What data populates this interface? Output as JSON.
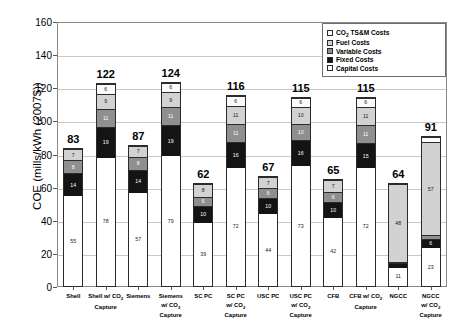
{
  "chart_data": {
    "type": "bar",
    "subtype": "stacked",
    "title": "",
    "xlabel": "",
    "ylabel": "COE (mills/kWh (2007$))",
    "ylim": [
      0,
      160
    ],
    "ytick_step": 20,
    "yticks": [
      0,
      20,
      40,
      60,
      80,
      100,
      120,
      140,
      160
    ],
    "grid": true,
    "legend_position": "top-right",
    "legend": [
      "CO2 TS&M Costs",
      "Fuel Costs",
      "Variable Costs",
      "Fixed Costs",
      "Capital Costs"
    ],
    "categories": [
      "Shell",
      "Shell w/ CO2 Capture",
      "Siemens",
      "Siemens w/ CO2 Capture",
      "SC PC",
      "SC PC w/ CO2 Capture",
      "USC PC",
      "USC PC w/ CO2 Capture",
      "CFB",
      "CFB w/ CO2 Capture",
      "NGCC",
      "NGCC w/ CO2 Capture"
    ],
    "series": [
      {
        "name": "Capital Costs",
        "values": [
          55,
          78,
          57,
          79,
          39,
          72,
          44,
          73,
          42,
          72,
          11,
          23
        ]
      },
      {
        "name": "Fixed Costs",
        "values": [
          14,
          19,
          14,
          19,
          10,
          16,
          10,
          16,
          10,
          15,
          3,
          6
        ]
      },
      {
        "name": "Variable Costs",
        "values": [
          8,
          11,
          8,
          11,
          6,
          11,
          6,
          10,
          6,
          11,
          1,
          2
        ]
      },
      {
        "name": "Fuel Costs",
        "values": [
          7,
          9,
          7,
          9,
          8,
          11,
          7,
          10,
          7,
          11,
          48,
          57
        ]
      },
      {
        "name": "CO2 TS&M Costs",
        "values": [
          0,
          6,
          0,
          6,
          0,
          6,
          0,
          6,
          0,
          6,
          0,
          3
        ]
      }
    ],
    "totals": [
      83,
      122,
      87,
      124,
      62,
      116,
      67,
      115,
      65,
      115,
      64,
      91
    ]
  },
  "axis": {
    "y_title": "COE (mills/kWh (2007$))",
    "y_tick_labels": [
      "0",
      "20",
      "40",
      "60",
      "80",
      "100",
      "120",
      "140",
      "160"
    ]
  },
  "legend": {
    "items": [
      {
        "label_pre": "CO",
        "label_sub": "2",
        "label_post": " TS&M Costs",
        "color": "#fbfbfb"
      },
      {
        "label_pre": "Fuel Costs",
        "label_sub": "",
        "label_post": "",
        "color": "#d2d2d2"
      },
      {
        "label_pre": "Variable Costs",
        "label_sub": "",
        "label_post": "",
        "color": "#8f8f8f"
      },
      {
        "label_pre": "Fixed Costs",
        "label_sub": "",
        "label_post": "",
        "color": "#141414"
      },
      {
        "label_pre": "Capital Costs",
        "label_sub": "",
        "label_post": "",
        "color": "#ffffff"
      }
    ]
  },
  "x_axis_labels": [
    [
      "Shell"
    ],
    [
      "Shell w/ CO",
      "2"
    ],
    [
      "Siemens"
    ],
    [
      "Siemens",
      "w/ CO",
      "2",
      "Capture"
    ],
    [
      "SC PC"
    ],
    [
      "SC PC",
      "w/ CO",
      "2",
      "Capture"
    ],
    [
      "USC PC"
    ],
    [
      "USC PC",
      "w/ CO",
      "2",
      "Capture"
    ],
    [
      "CFB"
    ],
    [
      "CFB w/ CO",
      "2"
    ],
    [
      "NGCC"
    ],
    [
      "NGCC",
      "w/ CO",
      "2",
      "Capture"
    ]
  ],
  "colors": {
    "capital": "#ffffff",
    "fixed": "#141414",
    "variable": "#8f8f8f",
    "fuel": "#d2d2d2",
    "tsm": "#fbfbfb",
    "grid": "#c8c8c8",
    "axis": "#8a8a8a"
  }
}
